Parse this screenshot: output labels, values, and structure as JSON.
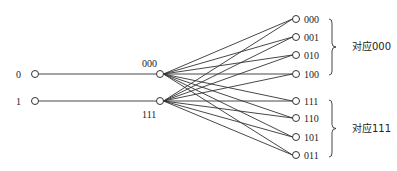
{
  "diagram": {
    "type": "code-mapping",
    "inputs": [
      {
        "id": "in0",
        "label": "0",
        "x": 35,
        "y": 74,
        "label_x": 16,
        "label_y": 78
      },
      {
        "id": "in1",
        "label": "1",
        "x": 35,
        "y": 101,
        "label_x": 16,
        "label_y": 105
      }
    ],
    "codewords": [
      {
        "id": "c000",
        "label": "000",
        "x": 160,
        "y": 74,
        "label_x": 142,
        "label_y": 67
      },
      {
        "id": "c111",
        "label": "111",
        "x": 160,
        "y": 101,
        "label_x": 142,
        "label_y": 118
      }
    ],
    "outputs": [
      {
        "id": "o000",
        "label": "000",
        "x": 296,
        "y": 19
      },
      {
        "id": "o001",
        "label": "001",
        "x": 296,
        "y": 37
      },
      {
        "id": "o010",
        "label": "010",
        "x": 296,
        "y": 55
      },
      {
        "id": "o100",
        "label": "100",
        "x": 296,
        "y": 74
      },
      {
        "id": "o111",
        "label": "111",
        "x": 296,
        "y": 101
      },
      {
        "id": "o110",
        "label": "110",
        "x": 296,
        "y": 118
      },
      {
        "id": "o101",
        "label": "101",
        "x": 296,
        "y": 137
      },
      {
        "id": "o011",
        "label": "011",
        "x": 296,
        "y": 155
      }
    ],
    "groups": [
      {
        "label": "对应000",
        "brace_x": 332,
        "y_top": 19,
        "y_bottom": 75,
        "label_x": 352,
        "label_y": 50
      },
      {
        "label": "对应111",
        "brace_x": 332,
        "y_top": 100,
        "y_bottom": 157,
        "label_x": 352,
        "label_y": 132
      }
    ],
    "edges_note": "Each input connects to its codeword; each codeword connects to all 8 outputs.",
    "colors": {
      "line": "#333333",
      "node_fill": "#ffffff",
      "node_stroke": "#333333",
      "text": "#222222"
    }
  }
}
